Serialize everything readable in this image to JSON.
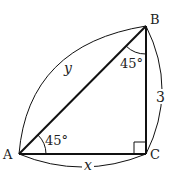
{
  "diagram": {
    "type": "right-triangle",
    "vertices": {
      "A": {
        "label": "A"
      },
      "B": {
        "label": "B"
      },
      "C": {
        "label": "C"
      }
    },
    "angles": {
      "A": "45°",
      "B": "45°",
      "C": "right-angle"
    },
    "sides": {
      "AB": "y",
      "BC": "3",
      "AC": "x"
    },
    "colors": {
      "stroke": "#111111",
      "background": "#ffffff"
    }
  }
}
